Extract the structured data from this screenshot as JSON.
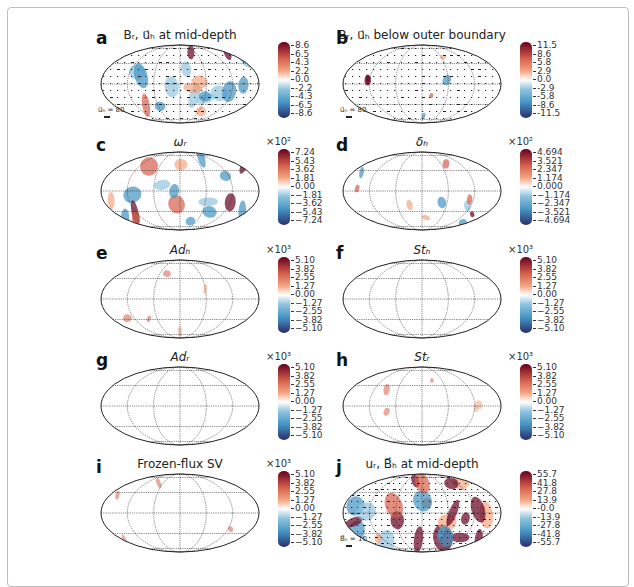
{
  "figure": {
    "panels": [
      {
        "id": "a",
        "letter": "a",
        "title": "Bᵣ, u⃗ₕ at mid-depth",
        "title_style": "normal",
        "colorbar": {
          "exponent": "",
          "ticks": [
            "8.6",
            "6.5",
            "4.3",
            "2.2",
            "0.0",
            "-2.2",
            "-4.3",
            "-6.5",
            "-8.6"
          ]
        },
        "vector_key": "u⃗ₕ = 80",
        "density": "high",
        "has_arrows": true
      },
      {
        "id": "b",
        "letter": "b",
        "title": "Bᵣ, u⃗ₕ below outer boundary",
        "title_style": "normal",
        "colorbar": {
          "exponent": "",
          "ticks": [
            "11.5",
            "8.6",
            "5.8",
            "2.9",
            "0.0",
            "-2.9",
            "-5.8",
            "-8.6",
            "-11.5"
          ]
        },
        "vector_key": "u⃗ₕ = 80",
        "density": "low",
        "has_arrows": true
      },
      {
        "id": "c",
        "letter": "c",
        "title": "ωᵣ",
        "title_style": "italic",
        "colorbar": {
          "exponent": "×10²",
          "ticks": [
            "7.24",
            "5.43",
            "3.62",
            "1.81",
            "0.00",
            "−1.81",
            "−3.62",
            "−5.43",
            "−7.24"
          ]
        },
        "vector_key": "",
        "density": "high",
        "has_arrows": false
      },
      {
        "id": "d",
        "letter": "d",
        "title": "δₕ",
        "title_style": "italic",
        "colorbar": {
          "exponent": "×10²",
          "ticks": [
            "4.694",
            "3.521",
            "2.347",
            "1.174",
            "0.000",
            "−1.174",
            "−2.347",
            "−3.521",
            "−4.694"
          ]
        },
        "vector_key": "",
        "density": "medium",
        "has_arrows": false
      },
      {
        "id": "e",
        "letter": "e",
        "title": "Adₕ",
        "title_style": "italic",
        "colorbar": {
          "exponent": "×10³",
          "ticks": [
            "5.10",
            "3.82",
            "2.55",
            "1.27",
            "0.00",
            "−1.27",
            "−2.55",
            "−3.82",
            "−5.10"
          ]
        },
        "vector_key": "",
        "density": "sparse",
        "has_arrows": false
      },
      {
        "id": "f",
        "letter": "f",
        "title": "Stₕ",
        "title_style": "italic",
        "colorbar": {
          "exponent": "×10³",
          "ticks": [
            "5.10",
            "3.82",
            "2.55",
            "1.27",
            "0.00",
            "−1.27",
            "−2.55",
            "−3.82",
            "−5.10"
          ]
        },
        "vector_key": "",
        "density": "none",
        "has_arrows": false
      },
      {
        "id": "g",
        "letter": "g",
        "title": "Adᵣ",
        "title_style": "italic",
        "colorbar": {
          "exponent": "×10³",
          "ticks": [
            "5.10",
            "3.82",
            "2.55",
            "1.27",
            "0.00",
            "−1.27",
            "−2.55",
            "−3.82",
            "−5.10"
          ]
        },
        "vector_key": "",
        "density": "none",
        "has_arrows": false
      },
      {
        "id": "h",
        "letter": "h",
        "title": "Stᵣ",
        "title_style": "italic",
        "colorbar": {
          "exponent": "×10³",
          "ticks": [
            "5.10",
            "3.82",
            "2.55",
            "1.27",
            "0.00",
            "−1.27",
            "−2.55",
            "−3.82",
            "−5.10"
          ]
        },
        "vector_key": "",
        "density": "sparse",
        "has_arrows": false
      },
      {
        "id": "i",
        "letter": "i",
        "title": "Frozen-flux SV",
        "title_style": "normal",
        "colorbar": {
          "exponent": "×10³",
          "ticks": [
            "5.10",
            "3.82",
            "2.55",
            "1.27",
            "0.00",
            "−1.27",
            "−2.55",
            "−3.82",
            "−5.10"
          ]
        },
        "vector_key": "",
        "density": "sparse",
        "has_arrows": false
      },
      {
        "id": "j",
        "letter": "j",
        "title": "uᵣ, B⃗ₕ at mid-depth",
        "title_style": "normal",
        "colorbar": {
          "exponent": "",
          "ticks": [
            "55.7",
            "41.8",
            "27.8",
            "13.9",
            "-0.0",
            "-13.9",
            "-27.8",
            "-41.8",
            "-55.7"
          ]
        },
        "vector_key": "B⃗ₕ = 10",
        "density": "very-high",
        "has_arrows": true
      }
    ],
    "colors": {
      "positive_max": "#67001f",
      "positive_mid": "#d6604d",
      "positive_low": "#f4a582",
      "neutral": "#ffffff",
      "negative_low": "#92c5de",
      "negative_mid": "#4393c3",
      "negative_max": "#2a2d6b",
      "grid": "#333333",
      "frame_border": "#bdbdbd"
    }
  },
  "chart_data": [
    {
      "type": "heatmap",
      "panel": "a",
      "title": "B_r, u_h at mid-depth",
      "projection": "Mollweide",
      "colorbar_range": [
        -8.6,
        8.6
      ],
      "colorbar_ticks": [
        8.6,
        6.5,
        4.3,
        2.2,
        0.0,
        -2.2,
        -4.3,
        -6.5,
        -8.6
      ],
      "vector_scale": "u_h = 80"
    },
    {
      "type": "heatmap",
      "panel": "b",
      "title": "B_r, u_h below outer boundary",
      "projection": "Mollweide",
      "colorbar_range": [
        -11.5,
        11.5
      ],
      "colorbar_ticks": [
        11.5,
        8.6,
        5.8,
        2.9,
        0.0,
        -2.9,
        -5.8,
        -8.6,
        -11.5
      ],
      "vector_scale": "u_h = 80"
    },
    {
      "type": "heatmap",
      "panel": "c",
      "title": "omega_r",
      "projection": "Mollweide",
      "colorbar_multiplier": "x10^2",
      "colorbar_range": [
        -7.24,
        7.24
      ],
      "colorbar_ticks": [
        7.24,
        5.43,
        3.62,
        1.81,
        0.0,
        -1.81,
        -3.62,
        -5.43,
        -7.24
      ]
    },
    {
      "type": "heatmap",
      "panel": "d",
      "title": "delta_h",
      "projection": "Mollweide",
      "colorbar_multiplier": "x10^2",
      "colorbar_range": [
        -4.694,
        4.694
      ],
      "colorbar_ticks": [
        4.694,
        3.521,
        2.347,
        1.174,
        0.0,
        -1.174,
        -2.347,
        -3.521,
        -4.694
      ]
    },
    {
      "type": "heatmap",
      "panel": "e",
      "title": "Ad_h",
      "projection": "Mollweide",
      "colorbar_multiplier": "x10^3",
      "colorbar_range": [
        -5.1,
        5.1
      ],
      "colorbar_ticks": [
        5.1,
        3.82,
        2.55,
        1.27,
        0.0,
        -1.27,
        -2.55,
        -3.82,
        -5.1
      ]
    },
    {
      "type": "heatmap",
      "panel": "f",
      "title": "St_h",
      "projection": "Mollweide",
      "colorbar_multiplier": "x10^3",
      "colorbar_range": [
        -5.1,
        5.1
      ],
      "colorbar_ticks": [
        5.1,
        3.82,
        2.55,
        1.27,
        0.0,
        -1.27,
        -2.55,
        -3.82,
        -5.1
      ]
    },
    {
      "type": "heatmap",
      "panel": "g",
      "title": "Ad_r",
      "projection": "Mollweide",
      "colorbar_multiplier": "x10^3",
      "colorbar_range": [
        -5.1,
        5.1
      ],
      "colorbar_ticks": [
        5.1,
        3.82,
        2.55,
        1.27,
        0.0,
        -1.27,
        -2.55,
        -3.82,
        -5.1
      ]
    },
    {
      "type": "heatmap",
      "panel": "h",
      "title": "St_r",
      "projection": "Mollweide",
      "colorbar_multiplier": "x10^3",
      "colorbar_range": [
        -5.1,
        5.1
      ],
      "colorbar_ticks": [
        5.1,
        3.82,
        2.55,
        1.27,
        0.0,
        -1.27,
        -2.55,
        -3.82,
        -5.1
      ]
    },
    {
      "type": "heatmap",
      "panel": "i",
      "title": "Frozen-flux SV",
      "projection": "Mollweide",
      "colorbar_multiplier": "x10^3",
      "colorbar_range": [
        -5.1,
        5.1
      ],
      "colorbar_ticks": [
        5.1,
        3.82,
        2.55,
        1.27,
        0.0,
        -1.27,
        -2.55,
        -3.82,
        -5.1
      ]
    },
    {
      "type": "heatmap",
      "panel": "j",
      "title": "u_r, B_h at mid-depth",
      "projection": "Mollweide",
      "colorbar_range": [
        -55.7,
        55.7
      ],
      "colorbar_ticks": [
        55.7,
        41.8,
        27.8,
        13.9,
        -0.0,
        -13.9,
        -27.8,
        -41.8,
        -55.7
      ],
      "vector_scale": "B_h = 10"
    }
  ]
}
